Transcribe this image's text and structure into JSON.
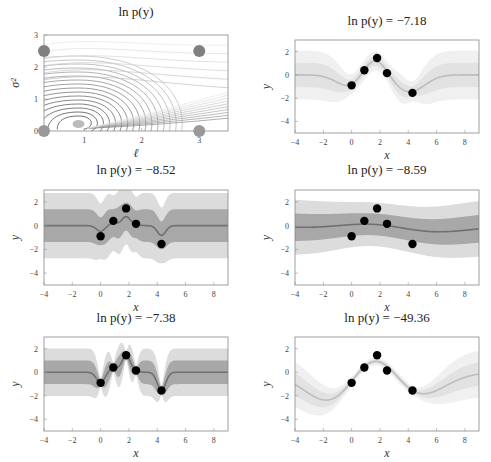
{
  "figure": {
    "panels": [
      {
        "id": "contour",
        "title": "ln p(y)",
        "xlabel": "ℓ",
        "ylabel": "σ²"
      },
      {
        "id": "p1",
        "title": "ln p(y) = −7.18",
        "xlabel": "x",
        "ylabel": "y"
      },
      {
        "id": "p2",
        "title": "ln p(y) = −8.52",
        "xlabel": "x",
        "ylabel": "y"
      },
      {
        "id": "p3",
        "title": "ln p(y) = −8.59",
        "xlabel": "x",
        "ylabel": "y"
      },
      {
        "id": "p4",
        "title": "ln p(y) = −7.38",
        "xlabel": "x",
        "ylabel": "y"
      },
      {
        "id": "p5",
        "title": "ln p(y) = −49.36",
        "xlabel": "x",
        "ylabel": "y"
      }
    ]
  },
  "chart_data": [
    {
      "type": "contour",
      "title": "ln p(y)",
      "xlabel": "ℓ",
      "ylabel": "σ²",
      "xlim": [
        0.3,
        3.5
      ],
      "ylim": [
        0,
        3
      ],
      "xticks": [
        1,
        2,
        3
      ],
      "yticks": [
        0,
        1,
        2,
        3
      ],
      "optimum": {
        "l": 0.9,
        "s2": 0.25
      },
      "markers": [
        {
          "l": 0.3,
          "s2": 2.5
        },
        {
          "l": 3,
          "s2": 2.5
        },
        {
          "l": 0.3,
          "s2": 0
        },
        {
          "l": 3,
          "s2": 0
        }
      ]
    },
    {
      "type": "line",
      "title": "ln p(y) = −7.18",
      "logml": -7.18,
      "lengthscale": 1.0,
      "signal_var": 1.0,
      "noise": 0.1,
      "band_style": "light"
    },
    {
      "type": "line",
      "title": "ln p(y) = −8.52",
      "logml": -8.52,
      "lengthscale": 0.3,
      "signal_var": 1.0,
      "noise": 0.9,
      "band_style": "dark"
    },
    {
      "type": "line",
      "title": "ln p(y) = −8.59",
      "logml": -8.59,
      "lengthscale": 3.0,
      "signal_var": 0.7,
      "noise": 0.7,
      "band_style": "dark"
    },
    {
      "type": "line",
      "title": "ln p(y) = −7.38",
      "logml": -7.38,
      "lengthscale": 0.3,
      "signal_var": 1.0,
      "noise": 0.02,
      "band_style": "dark"
    },
    {
      "type": "line",
      "title": "ln p(y) = −49.36",
      "logml": -49.36,
      "lengthscale": 2.2,
      "signal_var": 1.0,
      "noise": 0.02,
      "band_style": "light"
    }
  ],
  "shared": {
    "xlim": [
      -4,
      9
    ],
    "ylim": [
      -5,
      3
    ],
    "xticks": [
      -4,
      -2,
      0,
      2,
      4,
      6,
      8
    ],
    "yticks": [
      -4,
      -2,
      0,
      2
    ],
    "points": [
      {
        "x": 0,
        "y": -0.9
      },
      {
        "x": 0.9,
        "y": 0.4
      },
      {
        "x": 1.8,
        "y": 1.45
      },
      {
        "x": 2.5,
        "y": 0.15
      },
      {
        "x": 4.3,
        "y": -1.55
      }
    ]
  }
}
